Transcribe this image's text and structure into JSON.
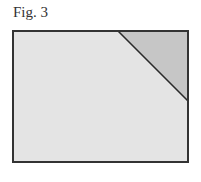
{
  "figure": {
    "label": "Fig. 3",
    "colors": {
      "outline": "#333333",
      "fill": "#e4e4e4",
      "corner_fill": "#c6c6c6"
    },
    "rectangle": {
      "x": 13,
      "y": 31,
      "width": 175,
      "height": 131
    },
    "diagonal": {
      "x1": 118,
      "y1": 31,
      "x2": 188,
      "y2": 101
    }
  }
}
